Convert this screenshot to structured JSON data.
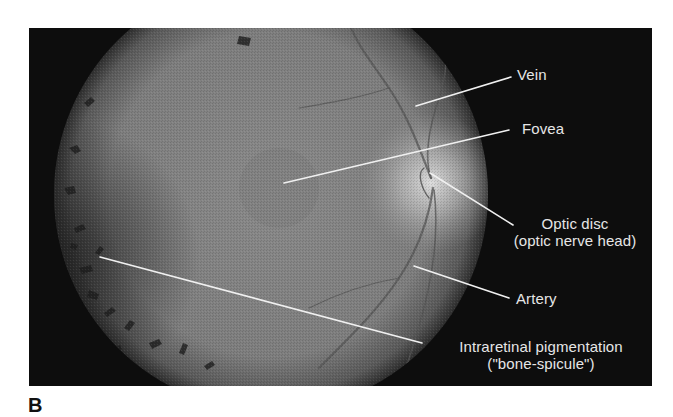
{
  "figure": {
    "panel_letter": "B",
    "labels": {
      "vein": "Vein",
      "fovea": "Fovea",
      "optic_disc_line1": "Optic disc",
      "optic_disc_line2": "(optic nerve head)",
      "artery": "Artery",
      "pigmentation_line1": "Intraretinal pigmentation",
      "pigmentation_line2": "(\"bone-spicule\")"
    },
    "colors": {
      "background": "#0d0d0d",
      "label_text": "#e6e6e6",
      "leader_line": "#f0f0f0"
    }
  }
}
